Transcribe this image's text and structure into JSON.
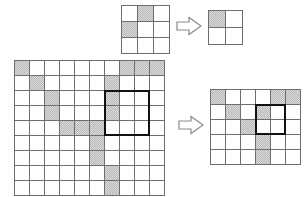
{
  "figure": {
    "title": "",
    "colors": {
      "shaded_cell": "#b9b9b9",
      "grid_line": "#6e6e6e",
      "highlight_box": "#111111",
      "arrow_stroke": "#8a8a8a",
      "background": "#ffffff"
    }
  },
  "panels": {
    "top_source": {
      "name": "small-source-grid",
      "rows": 3,
      "cols": 3,
      "cell_px": 16,
      "origin": {
        "x": 121,
        "y": 5
      },
      "shaded_cells": [
        [
          0,
          1
        ],
        [
          1,
          0
        ]
      ],
      "highlight_box": null
    },
    "top_result": {
      "name": "small-result-grid",
      "rows": 2,
      "cols": 2,
      "cell_px": 17,
      "origin": {
        "x": 208,
        "y": 10
      },
      "shaded_cells": [
        [
          0,
          0
        ]
      ],
      "highlight_box": null
    },
    "bottom_source": {
      "name": "large-source-grid",
      "rows": 9,
      "cols": 10,
      "cell_px": 15,
      "origin": {
        "x": 14,
        "y": 60
      },
      "shaded_cells": [
        [
          0,
          0
        ],
        [
          0,
          7
        ],
        [
          0,
          8
        ],
        [
          0,
          9
        ],
        [
          1,
          1
        ],
        [
          1,
          6
        ],
        [
          2,
          2
        ],
        [
          2,
          6
        ],
        [
          3,
          2
        ],
        [
          3,
          6
        ],
        [
          4,
          3
        ],
        [
          4,
          4
        ],
        [
          4,
          5
        ],
        [
          5,
          5
        ],
        [
          6,
          5
        ],
        [
          7,
          6
        ],
        [
          8,
          6
        ]
      ],
      "highlight_box": {
        "row": 2,
        "col": 6,
        "rows": 3,
        "cols": 3
      }
    },
    "bottom_result": {
      "name": "large-result-grid",
      "rows": 5,
      "cols": 6,
      "cell_px": 15,
      "origin": {
        "x": 210,
        "y": 89
      },
      "shaded_cells": [
        [
          0,
          0
        ],
        [
          0,
          4
        ],
        [
          0,
          5
        ],
        [
          1,
          1
        ],
        [
          1,
          3
        ],
        [
          2,
          2
        ],
        [
          3,
          3
        ],
        [
          4,
          3
        ]
      ],
      "highlight_box": {
        "row": 1,
        "col": 3,
        "rows": 2,
        "cols": 2
      }
    }
  },
  "arrows": [
    {
      "name": "top-arrow",
      "x": 176,
      "y": 16,
      "w": 26,
      "h": 20,
      "direction": "right"
    },
    {
      "name": "bottom-arrow",
      "x": 178,
      "y": 115,
      "w": 26,
      "h": 20,
      "direction": "right"
    }
  ]
}
